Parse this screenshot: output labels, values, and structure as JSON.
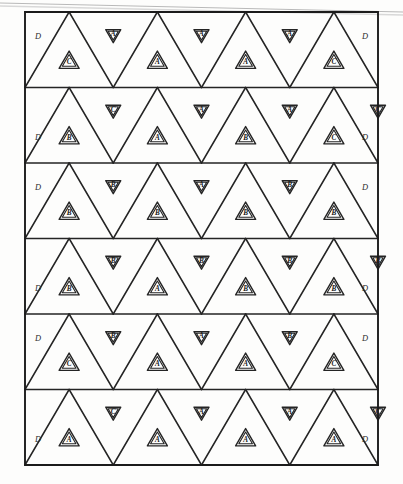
{
  "figure": {
    "border_color": "#1c1c1c",
    "line_color": "#242424",
    "ink_color": "#1a1a1a",
    "background_color": "#fdfdfc",
    "edge_label": "D",
    "scan_artifact": "faint diagonal scan line across top of page"
  },
  "geometry": {
    "left": 25,
    "right": 378,
    "top": 12,
    "bottom": 465,
    "rows": 6,
    "columns_upright": 4,
    "columns_inverted": 3,
    "row_height": 75.5,
    "cell_half_width": 44.125
  },
  "legend": {
    "letters": [
      "A",
      "B",
      "C",
      "D"
    ],
    "note": "A, B, C mark inner triangles; D marks the half triangles at the left and right borders."
  },
  "grid": {
    "rows": [
      {
        "index": 1,
        "left_edge_label": "D",
        "right_edge_label": "D",
        "upright": [
          "C",
          "A",
          "A",
          "C"
        ],
        "inverted": [
          "A",
          "A",
          "A"
        ]
      },
      {
        "index": 2,
        "left_edge_label": "D",
        "right_edge_label": "D",
        "upright": [
          "B",
          "A",
          "B",
          "C"
        ],
        "inverted": [
          "C",
          "A",
          "A",
          "C"
        ]
      },
      {
        "index": 3,
        "left_edge_label": "D",
        "right_edge_label": "D",
        "upright": [
          "B",
          "B",
          "B",
          "B"
        ],
        "inverted": [
          "B",
          "A",
          "B"
        ]
      },
      {
        "index": 4,
        "left_edge_label": "D",
        "right_edge_label": "D",
        "upright": [
          "B",
          "A",
          "B",
          "B"
        ],
        "inverted": [
          "B",
          "B",
          "B",
          "B"
        ]
      },
      {
        "index": 5,
        "left_edge_label": "D",
        "right_edge_label": "D",
        "upright": [
          "C",
          "A",
          "A",
          "C"
        ],
        "inverted": [
          "B",
          "A",
          "B"
        ]
      },
      {
        "index": 6,
        "left_edge_label": "D",
        "right_edge_label": "D",
        "upright": [
          "A",
          "A",
          "A",
          "A"
        ],
        "inverted": [
          "C",
          "A",
          "A",
          "C"
        ]
      }
    ]
  }
}
